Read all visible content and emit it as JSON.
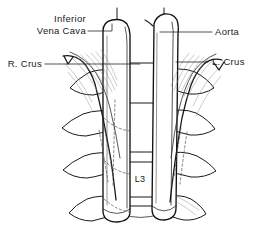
{
  "figure": {
    "background_color": "#ffffff",
    "ink_color": "#1a1a1a",
    "width": 273,
    "height": 247
  },
  "labels": {
    "inferior_vena_cava_line1": "Inferior",
    "inferior_vena_cava_line2": "Vena Cava",
    "right_crus": "R. Crus",
    "aorta": "Aorta",
    "left_crus": "L. Crus",
    "vertebra_l3": "L3"
  },
  "structures": [
    {
      "name": "inferior-vena-cava",
      "side": "right-of-midline-anatomic",
      "label": "Inferior Vena Cava"
    },
    {
      "name": "aorta",
      "side": "left-of-midline-anatomic",
      "label": "Aorta"
    },
    {
      "name": "right-crus",
      "side": "left-in-image",
      "label": "R. Crus"
    },
    {
      "name": "left-crus",
      "side": "right-in-image",
      "label": "L. Crus"
    },
    {
      "name": "lumbar-vertebra",
      "label": "L3"
    }
  ]
}
